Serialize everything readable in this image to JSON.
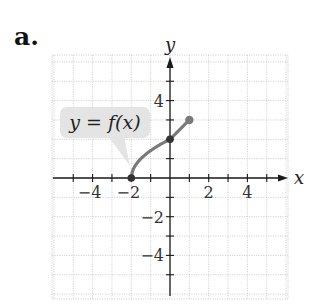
{
  "part_label": "a.",
  "chart_data": {
    "type": "line",
    "title": "",
    "xlabel": "x",
    "ylabel": "y",
    "xlim": [
      -6,
      6
    ],
    "ylim": [
      -6,
      6
    ],
    "grid": true,
    "x_ticks": [
      -5,
      -4,
      -3,
      -2,
      -1,
      1,
      2,
      3,
      4,
      5
    ],
    "y_ticks": [
      -5,
      -4,
      -3,
      -2,
      -1,
      1,
      2,
      3,
      4,
      5
    ],
    "x_tick_labels": [
      {
        "value": -4,
        "text": "−4"
      },
      {
        "value": -2,
        "text": "−2"
      },
      {
        "value": 2,
        "text": "2"
      },
      {
        "value": 4,
        "text": "4"
      }
    ],
    "y_tick_labels": [
      {
        "value": 4,
        "text": "4"
      },
      {
        "value": -2,
        "text": "−2"
      },
      {
        "value": -4,
        "text": "−4"
      }
    ],
    "series": [
      {
        "name": "y = f(x)",
        "segments": [
          {
            "kind": "curve",
            "shape": "square-root",
            "from": [
              -2,
              0
            ],
            "to": [
              0,
              2
            ],
            "points": [
              [
                -2,
                0
              ],
              [
                -1.5,
                1
              ],
              [
                -1,
                1.41
              ],
              [
                -0.5,
                1.73
              ],
              [
                0,
                2
              ]
            ]
          },
          {
            "kind": "line",
            "from": [
              0,
              2
            ],
            "to": [
              1,
              3
            ]
          }
        ],
        "markers": [
          {
            "x": -2,
            "y": 0,
            "style": "closed-dark"
          },
          {
            "x": 0,
            "y": 2,
            "style": "closed-dark"
          },
          {
            "x": 1,
            "y": 3,
            "style": "closed-gray"
          }
        ],
        "color": "#7a7a7a"
      }
    ],
    "annotations": [
      {
        "text": "y = f(x)",
        "kind": "callout",
        "points_to": [
          -2.1,
          0.6
        ]
      }
    ]
  },
  "colors": {
    "curve": "#7a7a7a",
    "marker_dark": "#333333",
    "marker_gray": "#7a7a7a",
    "grid": "#c8c8c8",
    "axis": "#1a1a1a",
    "callout_bg": "#e4e4e4"
  }
}
